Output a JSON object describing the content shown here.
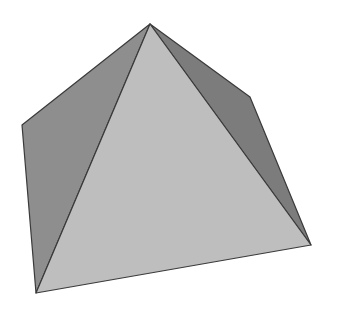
{
  "diagram": {
    "type": "3d-shape",
    "shape": "square pyramid",
    "width": 341,
    "height": 319,
    "background": "#ffffff",
    "vertices": {
      "apex": [
        150,
        24
      ],
      "left_back": [
        22,
        125
      ],
      "right_back": [
        250,
        97
      ],
      "front_left": [
        36,
        293
      ],
      "front_right": [
        311,
        245
      ]
    },
    "faces": [
      {
        "name": "left-face",
        "points": "150,24 22,125 36,293",
        "fill": "#8e8e8e"
      },
      {
        "name": "right-face",
        "points": "150,24 250,97 311,245",
        "fill": "#7c7c7c"
      },
      {
        "name": "front-face",
        "points": "150,24 36,293 311,245",
        "fill": "#bebebe"
      }
    ],
    "edge_color": "#3a3a3a",
    "edge_width": 1.2
  }
}
